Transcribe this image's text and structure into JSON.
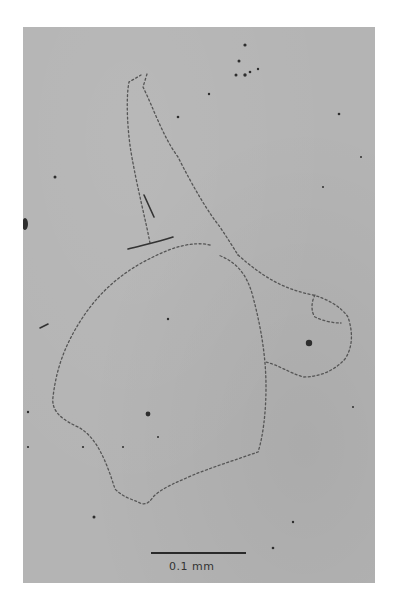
{
  "figure": {
    "type": "micrograph",
    "background_color": "#b4b4b4",
    "outline_color": "#4a4a4a",
    "scale_bar": {
      "label": "0.1 mm",
      "color": "#2a2a2a"
    }
  }
}
